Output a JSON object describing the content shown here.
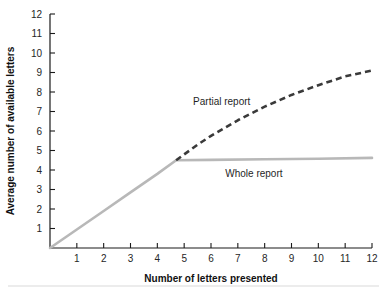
{
  "chart_data": {
    "type": "line",
    "title": "",
    "xlabel": "Number of letters presented",
    "ylabel": "Average number of available letters",
    "xlim": [
      0,
      12
    ],
    "ylim": [
      0,
      12
    ],
    "xticks": [
      1,
      2,
      3,
      4,
      5,
      6,
      7,
      8,
      9,
      10,
      11,
      12
    ],
    "yticks": [
      0,
      1,
      2,
      3,
      4,
      5,
      6,
      7,
      8,
      9,
      10,
      11,
      12
    ],
    "xtick_labels": [
      "1",
      "2",
      "3",
      "4",
      "5",
      "6",
      "7",
      "8",
      "9",
      "10",
      "11",
      "12"
    ],
    "ytick_labels": [
      "1",
      "2",
      "3",
      "4",
      "5",
      "6",
      "7",
      "8",
      "9",
      "10",
      "11",
      "12"
    ],
    "grid": false,
    "legend_position": "inline-annotation",
    "series": [
      {
        "name": "Partial report",
        "style": "dashed",
        "color": "#3a3a3a",
        "x": [
          0,
          1,
          2,
          3,
          4,
          4.7,
          5.5,
          6,
          7,
          8,
          9,
          10,
          11,
          12
        ],
        "values": [
          0,
          0.95,
          1.9,
          2.85,
          3.8,
          4.5,
          5.3,
          5.75,
          6.55,
          7.25,
          7.85,
          8.35,
          8.8,
          9.1
        ]
      },
      {
        "name": "Whole report",
        "style": "solid",
        "color": "#b8b8b8",
        "x": [
          0,
          1,
          2,
          3,
          4,
          4.7,
          6,
          8,
          10,
          12
        ],
        "values": [
          0,
          0.95,
          1.9,
          2.85,
          3.8,
          4.5,
          4.52,
          4.55,
          4.58,
          4.62
        ]
      }
    ],
    "annotations": [
      {
        "text": "Partial report",
        "x": 6.4,
        "y": 7.35
      },
      {
        "text": "Whole report",
        "x": 7.6,
        "y": 3.62
      }
    ]
  },
  "axis_titles": {
    "x": "Number of letters presented",
    "y": "Average number of available letters"
  },
  "colors": {
    "partial_report": "#3a3a3a",
    "whole_report": "#b8b8b8",
    "axis": "#1a1a1a",
    "tick_text": "#262626",
    "footer_rule": "#d9d9d9"
  },
  "footer": {
    "rule_visible": true
  }
}
